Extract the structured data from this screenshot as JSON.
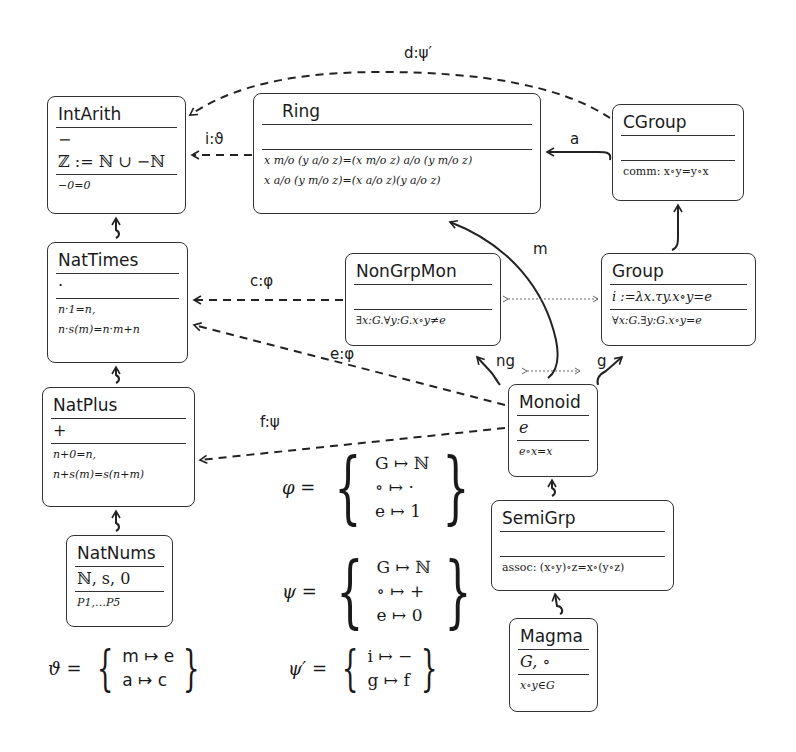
{
  "boxes": {
    "intarith": {
      "title": "IntArith",
      "sig": [
        "−",
        "ℤ := ℕ ∪ −ℕ"
      ],
      "axioms": [
        "−0=0"
      ]
    },
    "ring": {
      "title": "Ring",
      "sig": [
        ""
      ],
      "axioms": [
        "x m/ᴏ (y a/ᴏ z)=(x m/ᴏ z) a/ᴏ (y m/ᴏ z)",
        "x a/ᴏ (y m/ᴏ z)=(x a/ᴏ z)(y a/ᴏ z)"
      ]
    },
    "cgroup": {
      "title": "CGroup",
      "sig": [
        ""
      ],
      "axioms": [
        "comm: x∘y=y∘x"
      ]
    },
    "nattimes": {
      "title": "NatTimes",
      "sig": [
        "·"
      ],
      "axioms": [
        "n·1=n,",
        "n·s(m)=n·m+n"
      ]
    },
    "nongrpmon": {
      "title": "NonGrpMon",
      "sig": [
        ""
      ],
      "axioms": [
        "∃x:G.∀y:G.x∘y≠e"
      ]
    },
    "group": {
      "title": "Group",
      "sig": [
        "i :=λx.τy.x∘y=e"
      ],
      "axioms": [
        "∀x:G.∃y:G.x∘y=e"
      ]
    },
    "natplus": {
      "title": "NatPlus",
      "sig": [
        "+"
      ],
      "axioms": [
        "n+0=n,",
        "n+s(m)=s(n+m)"
      ]
    },
    "monoid": {
      "title": "Monoid",
      "sig": [
        "e"
      ],
      "axioms": [
        "e∘x=x"
      ]
    },
    "semigrp": {
      "title": "SemiGrp",
      "sig": [
        ""
      ],
      "axioms": [
        "assoc: (x∘y)∘z=x∘(y∘z)"
      ]
    },
    "natnums": {
      "title": "NatNums",
      "sig": [
        "ℕ, s, 0"
      ],
      "axioms": [
        "P1,…P5"
      ]
    },
    "magma": {
      "title": "Magma",
      "sig": [
        "G, ∘"
      ],
      "axioms": [
        "x∘y∈G"
      ]
    }
  },
  "edges": {
    "d": "d:ψ′",
    "i": "i:ϑ",
    "a": "a",
    "m": "m",
    "c": "c:φ",
    "e": "e:φ",
    "ng": "ng",
    "g": "g",
    "f": "f:ψ"
  },
  "mappings": {
    "phi": {
      "name": "φ =",
      "rows": [
        "G ↦ ℕ",
        "∘ ↦ ·",
        "e ↦ 1"
      ]
    },
    "psi": {
      "name": "ψ =",
      "rows": [
        "G ↦ ℕ",
        "∘ ↦ +",
        "e ↦ 0"
      ]
    },
    "theta": {
      "name": "ϑ =",
      "rows": [
        "m ↦ e",
        "a ↦ c"
      ]
    },
    "psiprime": {
      "name": "ψ′ =",
      "rows": [
        "i ↦ −",
        "g ↦ f"
      ]
    }
  }
}
